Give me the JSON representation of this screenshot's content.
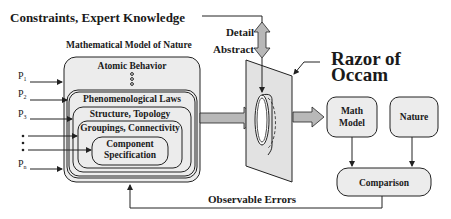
{
  "title": "Constraints, Expert Knowledge",
  "model": {
    "heading": "Mathematical Model of Nature",
    "layers": [
      {
        "label": "Atomic Behavior"
      },
      {
        "label": "Phenomenological Laws"
      },
      {
        "label": "Structure, Topology"
      },
      {
        "label": "Groupings, Connectivity"
      },
      {
        "label_line1": "Component",
        "label_line2": "Specification"
      }
    ]
  },
  "parameters": [
    {
      "name": "P",
      "sub": "1"
    },
    {
      "name": "P",
      "sub": "2"
    },
    {
      "name": "P",
      "sub": "3"
    },
    {
      "name": "•",
      "sub": ""
    },
    {
      "name": "•",
      "sub": ""
    },
    {
      "name": "•",
      "sub": ""
    },
    {
      "name": "P",
      "sub": "n"
    }
  ],
  "abstraction": {
    "top": "Detail",
    "bottom": "Abstract"
  },
  "razor": {
    "line1": "Razor of",
    "line2": "Occam"
  },
  "math_model": {
    "line1": "Math",
    "line2": "Model"
  },
  "nature": {
    "label": "Nature"
  },
  "comparison": {
    "label": "Comparison"
  },
  "feedback": {
    "label": "Observable Errors"
  },
  "colors": {
    "box_fill": "#ececec",
    "arrow_fill": "#b8b8b8",
    "stroke": "#222222"
  }
}
